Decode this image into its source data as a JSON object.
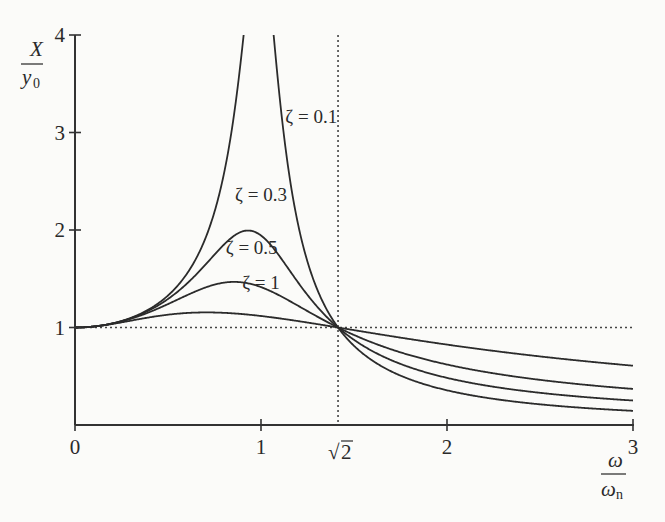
{
  "chart_data": {
    "type": "line",
    "title": "",
    "xlabel": "ω/ωn",
    "ylabel": "X/y0",
    "xlim": [
      0,
      3
    ],
    "ylim": [
      0,
      4
    ],
    "grid": false,
    "x_ticks": [
      {
        "value": 0,
        "label": "0"
      },
      {
        "value": 1,
        "label": "1"
      },
      {
        "value": 1.4142,
        "label": "√2"
      },
      {
        "value": 2,
        "label": "2"
      },
      {
        "value": 3,
        "label": "3"
      }
    ],
    "y_ticks": [
      {
        "value": 1,
        "label": "1"
      },
      {
        "value": 2,
        "label": "2"
      },
      {
        "value": 3,
        "label": "3"
      },
      {
        "value": 4,
        "label": "4"
      }
    ],
    "reference_lines": [
      {
        "orientation": "horizontal",
        "value": 1,
        "style": "dotted"
      },
      {
        "orientation": "vertical",
        "value": 1.4142,
        "style": "dotted"
      }
    ],
    "x": [
      0,
      0.25,
      0.5,
      0.75,
      0.9,
      1.0,
      1.1,
      1.25,
      1.4142,
      1.75,
      2.0,
      2.5,
      3.0
    ],
    "series": [
      {
        "name": "ζ = 0.1",
        "label": "ζ = 0.1",
        "zeta": 0.1,
        "values": [
          1.0,
          1.07,
          1.34,
          2.31,
          4.0,
          4.0,
          4.0,
          1.79,
          1.0,
          0.54,
          0.37,
          0.23,
          0.15
        ]
      },
      {
        "name": "ζ = 0.3",
        "label": "ζ = 0.3",
        "zeta": 0.3,
        "values": [
          1.0,
          1.07,
          1.31,
          1.83,
          1.98,
          1.94,
          1.77,
          1.41,
          1.0,
          0.66,
          0.52,
          0.39,
          0.32
        ]
      },
      {
        "name": "ζ = 0.5",
        "label": "ζ = 0.5",
        "zeta": 0.5,
        "values": [
          1.0,
          1.06,
          1.26,
          1.47,
          1.5,
          1.46,
          1.38,
          1.23,
          1.0,
          0.77,
          0.64,
          0.52,
          0.45
        ]
      },
      {
        "name": "ζ = 1",
        "label": "ζ = 1",
        "zeta": 1.0,
        "values": [
          1.0,
          1.03,
          1.12,
          1.16,
          1.15,
          1.12,
          1.09,
          1.05,
          1.0,
          0.9,
          0.82,
          0.72,
          0.64
        ]
      }
    ],
    "curve_labels": [
      {
        "text": "ζ = 0.1",
        "x": 1.27,
        "y": 3.1
      },
      {
        "text": "ζ = 0.3",
        "x": 1.0,
        "y": 2.3
      },
      {
        "text": "ζ = 0.5",
        "x": 0.95,
        "y": 1.75
      },
      {
        "text": "ζ = 1",
        "x": 1.0,
        "y": 1.4
      }
    ]
  },
  "labels": {
    "y_axis_num": "X",
    "y_axis_den": "y",
    "y_axis_den_sub": "0",
    "x_axis_num": "ω",
    "x_axis_den": "ω",
    "x_axis_den_sub": "n",
    "sqrt_symbol": "√",
    "sqrt_value": "2"
  }
}
